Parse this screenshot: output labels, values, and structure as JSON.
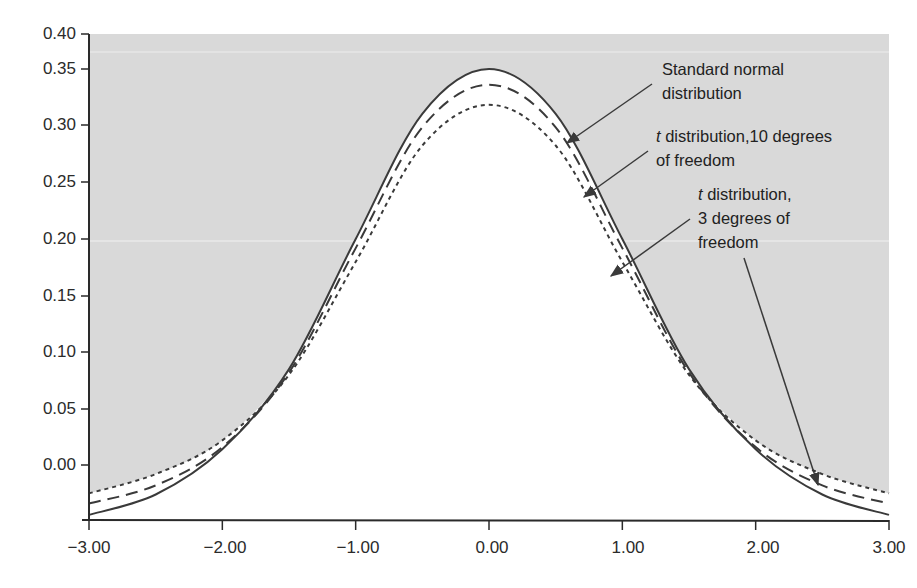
{
  "chart_data": {
    "type": "line",
    "title": "",
    "xlabel": "",
    "ylabel": "",
    "xlim": [
      -3.0,
      3.0
    ],
    "ylim": [
      -0.04,
      0.4
    ],
    "grid": false,
    "legend": "annotations with arrows (upper right)",
    "x_ticks": [
      "-3.00",
      "-2.00",
      "-1.00",
      "0.00",
      "1.00",
      "2.00",
      "3.00"
    ],
    "y_ticks": [
      "0.40",
      "0.35",
      "0.30",
      "0.25",
      "0.20",
      "0.15",
      "0.10",
      "0.05",
      "0.00"
    ],
    "background_fill": "gray region above/outside curves, white under curves",
    "series": [
      {
        "name": "Standard normal distribution",
        "style": "solid",
        "x": [
          -3.0,
          -2.5,
          -2.0,
          -1.5,
          -1.0,
          -0.5,
          0.0,
          0.5,
          1.0,
          1.5,
          2.0,
          2.5,
          3.0
        ],
        "values": [
          -0.044,
          -0.026,
          0.014,
          0.085,
          0.2,
          0.31,
          0.35,
          0.31,
          0.2,
          0.085,
          0.014,
          -0.026,
          -0.044
        ]
      },
      {
        "name": "t distribution, 10 degrees of freedom",
        "style": "dashed",
        "x": [
          -3.0,
          -2.5,
          -2.0,
          -1.5,
          -1.0,
          -0.5,
          0.0,
          0.5,
          1.0,
          1.5,
          2.0,
          2.5,
          3.0
        ],
        "values": [
          -0.034,
          -0.018,
          0.016,
          0.082,
          0.192,
          0.298,
          0.336,
          0.298,
          0.192,
          0.082,
          0.016,
          -0.018,
          -0.034
        ]
      },
      {
        "name": "t distribution, 3 degrees of freedom",
        "style": "dotted",
        "x": [
          -3.0,
          -2.5,
          -2.0,
          -1.5,
          -1.0,
          -0.5,
          0.0,
          0.5,
          1.0,
          1.5,
          2.0,
          2.5,
          3.0
        ],
        "values": [
          -0.025,
          -0.008,
          0.022,
          0.08,
          0.18,
          0.282,
          0.318,
          0.282,
          0.18,
          0.08,
          0.022,
          -0.008,
          -0.025
        ]
      }
    ],
    "annotations": [
      {
        "text": "Standard normal distribution",
        "lines": [
          "Standard normal",
          "distribution"
        ],
        "points_to": "solid curve near x=0.6"
      },
      {
        "text": "t distribution,10 degrees of freedom",
        "lines": [
          "t distribution,10 degrees",
          "of freedom"
        ],
        "points_to": "dashed curve near x=0.8"
      },
      {
        "text": "t distribution, 3 degrees of freedom",
        "lines": [
          "t distribution,",
          "3 degrees of",
          "freedom"
        ],
        "points_to": "dotted curve near x=0.9 and x=2.5"
      }
    ]
  },
  "labels": {
    "y": [
      "0.40",
      "0.35",
      "0.30",
      "0.25",
      "0.20",
      "0.15",
      "0.10",
      "0.05",
      "0.00"
    ],
    "x": [
      "−3.00",
      "−2.00",
      "−1.00",
      "0.00",
      "1.00",
      "2.00",
      "3.00"
    ],
    "annot_normal_1": "Standard normal",
    "annot_normal_2": "distribution",
    "annot_t10_t": "t",
    "annot_t10_1": " distribution,10 degrees",
    "annot_t10_2": "of freedom",
    "annot_t3_t": "t",
    "annot_t3_1": " distribution,",
    "annot_t3_2": "3 degrees of",
    "annot_t3_3": "freedom"
  },
  "colors": {
    "background_fill": "#d9d9d9",
    "under_curve": "#ffffff",
    "lines": "#3a3a3a",
    "axis": "#2a2a2a"
  }
}
